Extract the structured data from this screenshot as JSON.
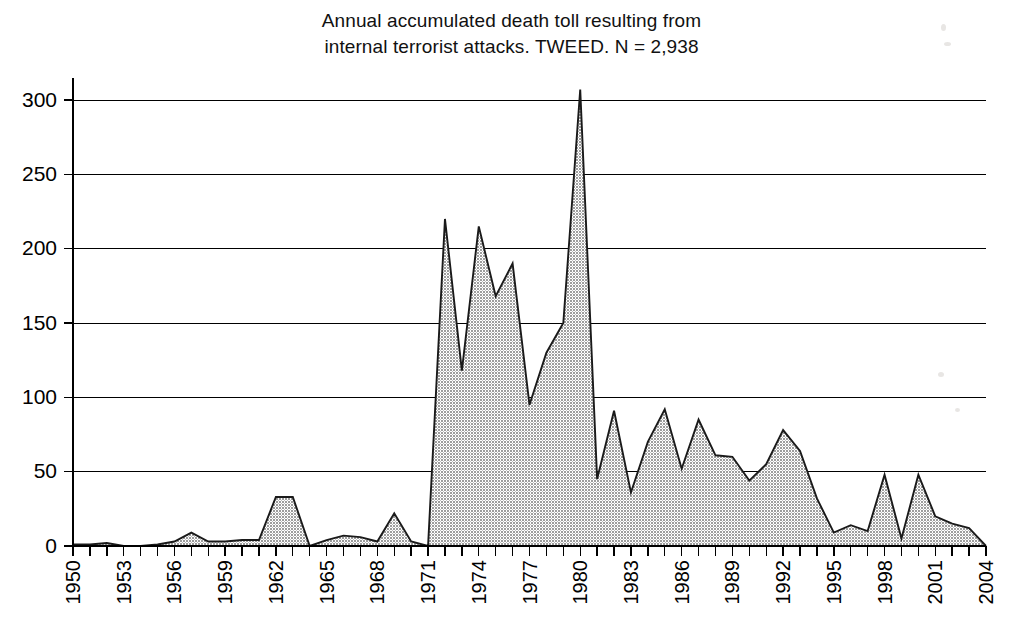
{
  "title": {
    "line1": "Annual accumulated death toll resulting from",
    "line2": "internal terrorist attacks. TWEED. N = 2,938"
  },
  "axes": {
    "y_ticks": [
      "0",
      "50",
      "100",
      "150",
      "200",
      "250",
      "300"
    ],
    "x_ticks_labeled": [
      "1950",
      "1953",
      "1956",
      "1959",
      "1962",
      "1965",
      "1968",
      "1971",
      "1974",
      "1977",
      "1980",
      "1983",
      "1986",
      "1989",
      "1992",
      "1995",
      "1998",
      "2001",
      "2004"
    ]
  },
  "colors": {
    "area_fill": "#a8a8a8",
    "area_stroke": "#1a1a1a",
    "grid": "#000000",
    "text": "#000000",
    "background": "#ffffff"
  },
  "chart_data": {
    "type": "area",
    "title": "Annual accumulated death toll resulting from internal terrorist attacks. TWEED. N = 2,938",
    "xlabel": "",
    "ylabel": "",
    "xlim": [
      1950,
      2004
    ],
    "ylim": [
      0,
      320
    ],
    "ytick_values": [
      0,
      50,
      100,
      150,
      200,
      250,
      300
    ],
    "grid": true,
    "legend": "none",
    "total_annotation": "N = 2,938",
    "x": [
      1950,
      1951,
      1952,
      1953,
      1954,
      1955,
      1956,
      1957,
      1958,
      1959,
      1960,
      1961,
      1962,
      1963,
      1964,
      1965,
      1966,
      1967,
      1968,
      1969,
      1970,
      1971,
      1972,
      1973,
      1974,
      1975,
      1976,
      1977,
      1978,
      1979,
      1980,
      1981,
      1982,
      1983,
      1984,
      1985,
      1986,
      1987,
      1988,
      1989,
      1990,
      1991,
      1992,
      1993,
      1994,
      1995,
      1996,
      1997,
      1998,
      1999,
      2000,
      2001,
      2002,
      2003,
      2004
    ],
    "values": [
      1,
      1,
      2,
      0,
      0,
      1,
      3,
      9,
      3,
      3,
      4,
      4,
      33,
      33,
      0,
      4,
      7,
      6,
      3,
      22,
      3,
      0,
      220,
      118,
      215,
      168,
      190,
      95,
      130,
      150,
      307,
      45,
      91,
      36,
      70,
      92,
      52,
      85,
      61,
      60,
      44,
      55,
      78,
      64,
      32,
      9,
      14,
      10,
      48,
      5,
      48,
      20,
      15,
      12,
      0
    ],
    "series": [
      {
        "name": "Annual accumulated death toll",
        "values": [
          1,
          1,
          2,
          0,
          0,
          1,
          3,
          9,
          3,
          3,
          4,
          4,
          33,
          33,
          0,
          4,
          7,
          6,
          3,
          22,
          3,
          0,
          220,
          118,
          215,
          168,
          190,
          95,
          130,
          150,
          307,
          45,
          91,
          36,
          70,
          92,
          52,
          85,
          61,
          60,
          44,
          55,
          78,
          64,
          32,
          9,
          14,
          10,
          48,
          5,
          48,
          20,
          15,
          12,
          0
        ]
      }
    ]
  }
}
